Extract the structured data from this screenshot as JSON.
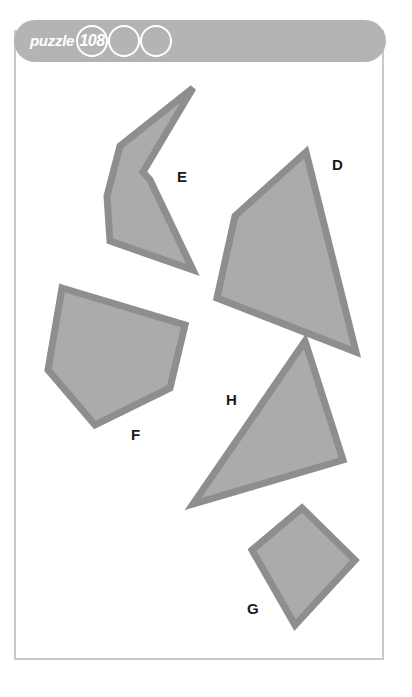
{
  "header": {
    "title": "puzzle",
    "number": "108",
    "circles": [
      "108",
      "",
      ""
    ],
    "bar_color": "#b4b4b4",
    "circle_stroke": "#ffffff"
  },
  "palette": {
    "shape_fill": "#ababab",
    "shape_stroke": "#8e8e8e",
    "page_border": "#c9c9c9",
    "background": "#ffffff",
    "label_color": "#1a1a1a"
  },
  "shapes": [
    {
      "label": "E",
      "type": "concave-polygon",
      "points": "193,88 120,146 107,196 110,241 193,270 150,180 143,172",
      "label_x": 177,
      "label_y": 169
    },
    {
      "label": "D",
      "type": "quadrilateral",
      "points": "306,152 235,216 217,298 356,352",
      "label_x": 332,
      "label_y": 157
    },
    {
      "label": "F",
      "type": "pentagon",
      "points": "62,288 185,325 170,388 95,425 48,370",
      "label_x": 131,
      "label_y": 427
    },
    {
      "label": "H",
      "type": "triangle",
      "points": "305,341 343,460 193,504",
      "label_x": 226,
      "label_y": 392
    },
    {
      "label": "G",
      "type": "kite",
      "points": "302,508 355,560 295,625 252,550",
      "label_x": 247,
      "label_y": 601
    }
  ]
}
